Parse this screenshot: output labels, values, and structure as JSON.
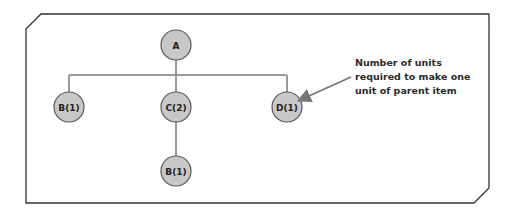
{
  "diagram": {
    "type": "product-structure-tree",
    "colors": {
      "node_fill": "#c8c8c8",
      "node_stroke": "#555555",
      "connector": "#9a9a9a",
      "frame": "#333333",
      "arrow": "#777777"
    },
    "nodes": [
      {
        "id": "A",
        "label": "A",
        "level": 0,
        "parent": null
      },
      {
        "id": "B1",
        "label": "B(1)",
        "level": 1,
        "parent": "A"
      },
      {
        "id": "C2",
        "label": "C(2)",
        "level": 1,
        "parent": "A"
      },
      {
        "id": "D1",
        "label": "D(1)",
        "level": 1,
        "parent": "A"
      },
      {
        "id": "B1b",
        "label": "B(1)",
        "level": 2,
        "parent": "C2"
      }
    ],
    "annotation": {
      "lines": [
        "Number of units",
        "required to make one",
        "unit of parent item"
      ],
      "points_to": "D1"
    }
  }
}
